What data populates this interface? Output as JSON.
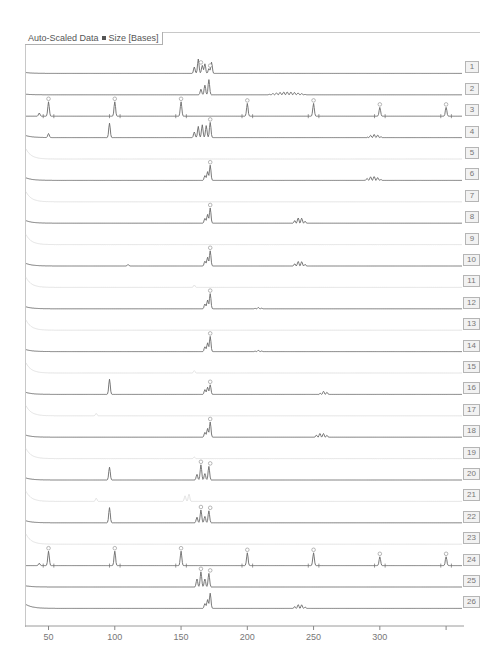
{
  "chart_data": {
    "type": "line",
    "title": "Auto-Scaled Data",
    "xlabel": "Size [Bases]",
    "ylabel": "",
    "xlim": [
      33,
      362
    ],
    "x_ticks": [
      50,
      100,
      150,
      200,
      250,
      300,
      350
    ],
    "x_tick_labels": [
      "50",
      "100",
      "150",
      "200",
      "250",
      "300",
      ""
    ],
    "grid": false,
    "legend": "none",
    "lanes": [
      {
        "name": "1",
        "style": "dark",
        "start_hump": 0.15,
        "peaks": [
          [
            160,
            0.4
          ],
          [
            163,
            0.9
          ],
          [
            166,
            0.5
          ],
          [
            168,
            0.6
          ],
          [
            171,
            0.3
          ],
          [
            173,
            0.7
          ]
        ],
        "markers": [
          165,
          172
        ],
        "cluster": null
      },
      {
        "name": "2",
        "style": "dark",
        "start_hump": 0.1,
        "peaks": [
          [
            165,
            0.35
          ],
          [
            168,
            0.6
          ],
          [
            171,
            0.95
          ]
        ],
        "markers": [],
        "cluster": [
          [
            215,
            245,
            0.18
          ]
        ]
      },
      {
        "name": "3",
        "style": "dark",
        "start_hump": 0,
        "peaks": [
          [
            43,
            0.2
          ],
          [
            50,
            0.9
          ],
          [
            100,
            0.9
          ],
          [
            150,
            0.9
          ],
          [
            200,
            0.8
          ],
          [
            250,
            0.8
          ],
          [
            300,
            0.55
          ],
          [
            350,
            0.55
          ]
        ],
        "markers": [
          50,
          100,
          150,
          200,
          250,
          300,
          350
        ],
        "cluster": null,
        "ladder": true
      },
      {
        "name": "4",
        "style": "dark",
        "start_hump": 0.35,
        "peaks": [
          [
            50,
            0.25
          ],
          [
            96,
            0.9
          ],
          [
            160,
            0.35
          ],
          [
            163,
            0.7
          ],
          [
            166,
            0.8
          ],
          [
            169,
            0.75
          ],
          [
            172,
            0.95
          ]
        ],
        "markers": [
          172
        ],
        "cluster": [
          [
            290,
            302,
            0.2
          ]
        ]
      },
      {
        "name": "5",
        "style": "faint",
        "start_hump": 0.7,
        "peaks": [],
        "markers": [],
        "cluster": null
      },
      {
        "name": "6",
        "style": "dark",
        "start_hump": 0.45,
        "peaks": [
          [
            168,
            0.3
          ],
          [
            170,
            0.55
          ],
          [
            172,
            0.95
          ]
        ],
        "markers": [
          172
        ],
        "cluster": [
          [
            288,
            302,
            0.25
          ]
        ]
      },
      {
        "name": "7",
        "style": "faint",
        "start_hump": 0.7,
        "peaks": [],
        "markers": [],
        "cluster": null
      },
      {
        "name": "8",
        "style": "dark",
        "start_hump": 0.45,
        "peaks": [
          [
            168,
            0.3
          ],
          [
            170,
            0.55
          ],
          [
            172,
            0.95
          ]
        ],
        "markers": [
          172
        ],
        "cluster": [
          [
            234,
            245,
            0.35
          ]
        ]
      },
      {
        "name": "9",
        "style": "faint",
        "start_hump": 0.7,
        "peaks": [],
        "markers": [],
        "cluster": null
      },
      {
        "name": "10",
        "style": "dark",
        "start_hump": 0.45,
        "peaks": [
          [
            110,
            0.1
          ],
          [
            168,
            0.3
          ],
          [
            170,
            0.55
          ],
          [
            172,
            0.95
          ]
        ],
        "markers": [
          172
        ],
        "cluster": [
          [
            234,
            245,
            0.3
          ]
        ]
      },
      {
        "name": "11",
        "style": "faint",
        "start_hump": 0.7,
        "peaks": [
          [
            160,
            0.15
          ]
        ],
        "markers": [],
        "cluster": null
      },
      {
        "name": "12",
        "style": "dark",
        "start_hump": 0.35,
        "peaks": [
          [
            168,
            0.3
          ],
          [
            170,
            0.55
          ],
          [
            172,
            0.95
          ]
        ],
        "markers": [
          172
        ],
        "cluster": [
          [
            205,
            212,
            0.08
          ]
        ]
      },
      {
        "name": "13",
        "style": "faint",
        "start_hump": 0.7,
        "peaks": [],
        "markers": [],
        "cluster": null
      },
      {
        "name": "14",
        "style": "dark",
        "start_hump": 0.35,
        "peaks": [
          [
            168,
            0.3
          ],
          [
            170,
            0.55
          ],
          [
            172,
            0.95
          ]
        ],
        "markers": [
          172
        ],
        "cluster": [
          [
            205,
            212,
            0.08
          ]
        ]
      },
      {
        "name": "15",
        "style": "faint",
        "start_hump": 0.7,
        "peaks": [
          [
            160,
            0.15
          ]
        ],
        "markers": [],
        "cluster": null
      },
      {
        "name": "16",
        "style": "dark",
        "start_hump": 0.35,
        "peaks": [
          [
            96,
            0.95
          ],
          [
            168,
            0.3
          ],
          [
            170,
            0.45
          ],
          [
            172,
            0.6
          ]
        ],
        "markers": [
          172
        ],
        "cluster": [
          [
            254,
            262,
            0.2
          ]
        ]
      },
      {
        "name": "17",
        "style": "faint",
        "start_hump": 0.7,
        "peaks": [
          [
            86,
            0.15
          ]
        ],
        "markers": [],
        "cluster": null
      },
      {
        "name": "18",
        "style": "dark",
        "start_hump": 0.35,
        "peaks": [
          [
            168,
            0.3
          ],
          [
            170,
            0.55
          ],
          [
            172,
            0.95
          ]
        ],
        "markers": [
          172
        ],
        "cluster": [
          [
            250,
            262,
            0.25
          ]
        ]
      },
      {
        "name": "19",
        "style": "faint",
        "start_hump": 0.7,
        "peaks": [
          [
            160,
            0.1
          ]
        ],
        "markers": [],
        "cluster": null
      },
      {
        "name": "20",
        "style": "dark",
        "start_hump": 0.35,
        "peaks": [
          [
            96,
            0.8
          ],
          [
            162,
            0.35
          ],
          [
            165,
            0.95
          ],
          [
            168,
            0.4
          ],
          [
            171,
            0.85
          ]
        ],
        "markers": [
          165,
          172
        ],
        "cluster": null
      },
      {
        "name": "21",
        "style": "faint",
        "start_hump": 0.7,
        "peaks": [
          [
            86,
            0.2
          ],
          [
            153,
            0.35
          ],
          [
            156,
            0.45
          ]
        ],
        "markers": [],
        "cluster": null
      },
      {
        "name": "22",
        "style": "dark",
        "start_hump": 0.35,
        "peaks": [
          [
            96,
            0.95
          ],
          [
            162,
            0.35
          ],
          [
            165,
            0.8
          ],
          [
            168,
            0.4
          ],
          [
            171,
            0.75
          ]
        ],
        "markers": [
          165,
          172
        ],
        "cluster": null
      },
      {
        "name": "23",
        "style": "faint",
        "start_hump": 0.7,
        "peaks": [],
        "markers": [],
        "cluster": null
      },
      {
        "name": "24",
        "style": "dark",
        "start_hump": 0,
        "peaks": [
          [
            43,
            0.15
          ],
          [
            50,
            0.9
          ],
          [
            100,
            0.9
          ],
          [
            150,
            0.9
          ],
          [
            200,
            0.8
          ],
          [
            250,
            0.8
          ],
          [
            300,
            0.55
          ],
          [
            350,
            0.55
          ]
        ],
        "markers": [
          50,
          100,
          150,
          200,
          250,
          300,
          350
        ],
        "cluster": null,
        "ladder": true
      },
      {
        "name": "25",
        "style": "dark",
        "start_hump": 0.2,
        "peaks": [
          [
            162,
            0.5
          ],
          [
            165,
            0.95
          ],
          [
            168,
            0.5
          ],
          [
            171,
            0.85
          ]
        ],
        "markers": [
          165,
          172
        ],
        "cluster": null
      },
      {
        "name": "26",
        "style": "dark",
        "start_hump": 0.7,
        "peaks": [
          [
            168,
            0.3
          ],
          [
            170,
            0.55
          ],
          [
            172,
            0.95
          ]
        ],
        "markers": [],
        "cluster": [
          [
            234,
            245,
            0.25
          ]
        ]
      }
    ]
  },
  "header": {
    "left": "Auto-Scaled Data",
    "right": "Size [Bases]"
  }
}
